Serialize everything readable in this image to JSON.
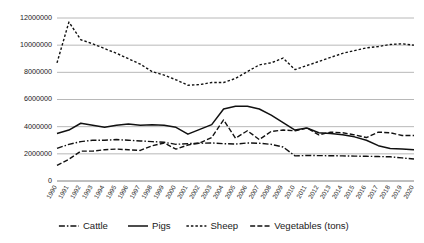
{
  "chart_data": {
    "type": "line",
    "title": "",
    "xlabel": "",
    "ylabel": "",
    "ylim": [
      0,
      12000000
    ],
    "ytick_step": 2000000,
    "ytick_labels": [
      "0",
      "2000000",
      "4000000",
      "6000000",
      "8000000",
      "10000000",
      "12000000"
    ],
    "ytick_values": [
      0,
      2000000,
      4000000,
      6000000,
      8000000,
      10000000,
      12000000
    ],
    "grid": true,
    "legend_position": "bottom",
    "categories": [
      "1990",
      "1991",
      "1992",
      "1993",
      "1994",
      "1995",
      "1996",
      "1997",
      "1998",
      "1999",
      "2000",
      "2001",
      "2002",
      "2003",
      "2004",
      "2005",
      "2006",
      "2007",
      "2008",
      "2009",
      "2010",
      "2011",
      "2012",
      "2013",
      "2014",
      "2015",
      "2016",
      "2017",
      "2018",
      "2019",
      "2020"
    ],
    "series": [
      {
        "name": "Cattle",
        "dash": "6,2,1.5,2",
        "values": [
          2400000,
          2700000,
          2900000,
          3000000,
          3000000,
          3050000,
          3000000,
          2950000,
          2900000,
          2850000,
          2700000,
          2750000,
          2780000,
          2800000,
          2750000,
          2720000,
          2800000,
          2780000,
          2700000,
          2500000,
          1850000,
          1880000,
          1870000,
          1860000,
          1850000,
          1830000,
          1820000,
          1800000,
          1780000,
          1700000,
          1620000
        ]
      },
      {
        "name": "Pigs",
        "dash": "none",
        "values": [
          3500000,
          3750000,
          4250000,
          4100000,
          3950000,
          4100000,
          4200000,
          4100000,
          4150000,
          4100000,
          3950000,
          3450000,
          3800000,
          4150000,
          5300000,
          5500000,
          5500000,
          5300000,
          4850000,
          4300000,
          3750000,
          3900000,
          3550000,
          3500000,
          3400000,
          3250000,
          3000000,
          2600000,
          2400000,
          2350000,
          2300000
        ]
      },
      {
        "name": "Sheep",
        "dash": "2.5,2",
        "values": [
          8700000,
          11700000,
          10400000,
          10100000,
          9750000,
          9400000,
          9000000,
          8600000,
          8050000,
          7800000,
          7450000,
          7050000,
          7100000,
          7250000,
          7250000,
          7550000,
          8050000,
          8550000,
          8700000,
          9050000,
          8200000,
          8500000,
          8800000,
          9100000,
          9400000,
          9600000,
          9800000,
          9900000,
          10050000,
          10100000,
          10000000
        ]
      },
      {
        "name": "Vegetables (tons)",
        "dash": "5,2.2",
        "values": [
          1150000,
          1600000,
          2200000,
          2200000,
          2300000,
          2350000,
          2300000,
          2250000,
          2600000,
          2800000,
          2350000,
          2650000,
          2800000,
          3200000,
          4500000,
          3150000,
          3700000,
          3050000,
          3650000,
          3750000,
          3700000,
          3900000,
          3400000,
          3600000,
          3550000,
          3400000,
          3200000,
          3600000,
          3550000,
          3350000,
          3350000
        ]
      }
    ]
  },
  "legend": {
    "items": [
      {
        "label": "Cattle"
      },
      {
        "label": "Pigs"
      },
      {
        "label": "Sheep"
      },
      {
        "label": "Vegetables (tons)"
      }
    ]
  },
  "colors": {
    "line": "#111111",
    "grid": "#a6a6a6",
    "axis": "#6f6f6f",
    "text": "#1a1a1a",
    "background": "#ffffff"
  }
}
